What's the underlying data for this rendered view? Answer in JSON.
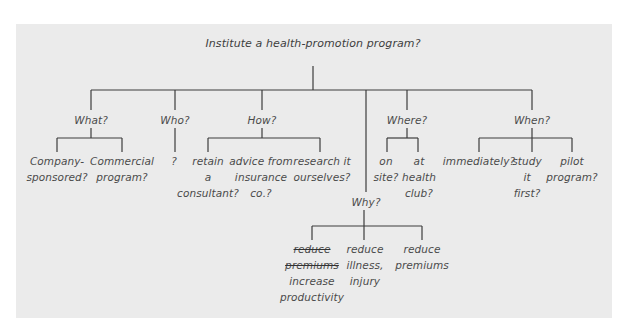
{
  "diagram": {
    "title": "Institute a health-promotion program?",
    "branches": [
      {
        "label": "What?",
        "children": [
          {
            "lines": [
              "Company-",
              "sponsored?"
            ]
          },
          {
            "lines": [
              "Commercial",
              "program?"
            ]
          }
        ]
      },
      {
        "label": "Who?",
        "children": [
          {
            "lines": [
              "?"
            ]
          }
        ]
      },
      {
        "label": "How?",
        "children": [
          {
            "lines": [
              "retain",
              "a",
              "consultant?"
            ]
          },
          {
            "lines": [
              "advice from",
              "insurance",
              "co.?"
            ]
          },
          {
            "lines": [
              "research it",
              "ourselves?"
            ]
          }
        ]
      },
      {
        "label": "Why?",
        "children": [
          {
            "struck_lines": [
              "reduce",
              "premiums"
            ],
            "lines": [
              "increase",
              "productivity"
            ]
          },
          {
            "lines": [
              "reduce",
              "illness,",
              "injury"
            ]
          },
          {
            "lines": [
              "reduce",
              "premiums"
            ]
          }
        ]
      },
      {
        "label": "Where?",
        "children": [
          {
            "lines": [
              "on",
              "site?"
            ]
          },
          {
            "lines": [
              "at",
              "health",
              "club?"
            ]
          }
        ]
      },
      {
        "label": "When?",
        "children": [
          {
            "lines": [
              "immediately?"
            ]
          },
          {
            "lines": [
              "study",
              "it",
              "first?"
            ]
          },
          {
            "lines": [
              "pilot",
              "program?"
            ]
          }
        ]
      }
    ]
  }
}
